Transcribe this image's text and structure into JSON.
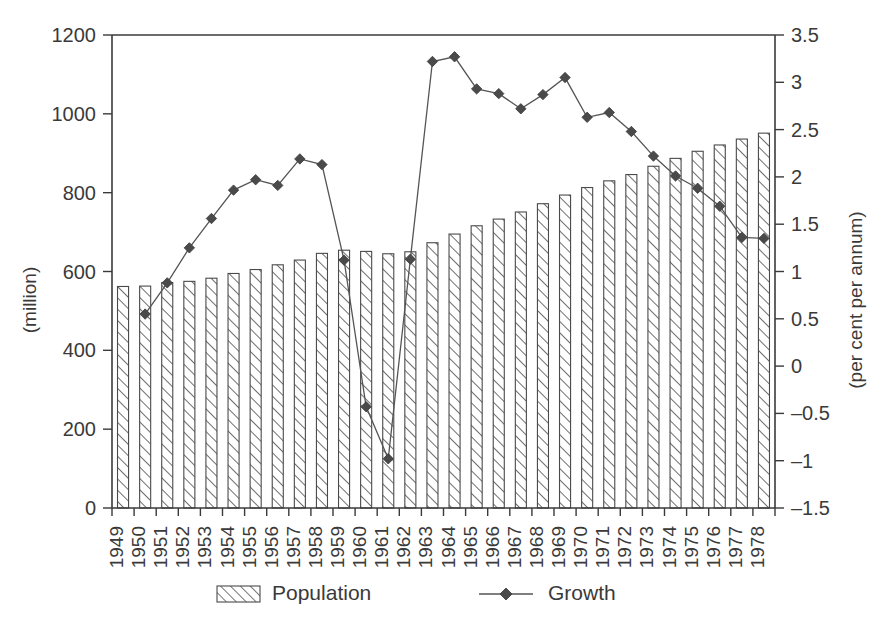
{
  "chart_data": {
    "type": "bar",
    "title": "",
    "subtitle": "",
    "xlabel": "",
    "ylabel": "(million)",
    "y2label": "(per cent per annum)",
    "ylim": [
      0,
      1200
    ],
    "y2lim": [
      -1.5,
      3.5
    ],
    "ytick_step": 200,
    "y2tick_step": 0.5,
    "grid": false,
    "legend_position": "bottom",
    "categories": [
      "1949",
      "1950",
      "1951",
      "1952",
      "1953",
      "1954",
      "1955",
      "1956",
      "1957",
      "1958",
      "1959",
      "1960",
      "1961",
      "1962",
      "1963",
      "1964",
      "1965",
      "1966",
      "1967",
      "1968",
      "1969",
      "1970",
      "1971",
      "1972",
      "1973",
      "1974",
      "1975",
      "1976",
      "1977",
      "1978"
    ],
    "yticks": [
      "0",
      "200",
      "400",
      "600",
      "800",
      "1000",
      "1200"
    ],
    "y2ticks": [
      "-1.5",
      "-1",
      "-0.5",
      "0",
      "0.5",
      "1",
      "1.5",
      "2",
      "2.5",
      "3",
      "3.5"
    ],
    "series": [
      {
        "name": "Population",
        "axis": "left",
        "type": "bar",
        "unit": "million",
        "values": [
          562,
          563,
          572,
          575,
          583,
          595,
          605,
          617,
          629,
          646,
          654,
          651,
          645,
          650,
          673,
          695,
          716,
          733,
          751,
          772,
          794,
          813,
          830,
          846,
          867,
          887,
          905,
          921,
          936,
          951
        ]
      },
      {
        "name": "Growth",
        "axis": "right",
        "type": "line",
        "marker": "diamond",
        "unit": "per cent per annum",
        "values": [
          null,
          0.55,
          0.88,
          1.25,
          1.56,
          1.86,
          1.97,
          1.91,
          2.19,
          2.13,
          1.12,
          -0.43,
          -0.98,
          1.13,
          3.22,
          3.27,
          2.93,
          2.88,
          2.72,
          2.87,
          3.05,
          2.63,
          2.68,
          2.48,
          2.22,
          2.01,
          1.88,
          1.69,
          1.36,
          1.35
        ]
      }
    ],
    "legend": [
      {
        "label": "Population",
        "style": "hatched-bar"
      },
      {
        "label": "Growth",
        "style": "line-diamond"
      }
    ],
    "colors": {
      "axis": "#3a3a3a",
      "bar_stroke": "#4a4a4a",
      "bar_fill": "#ffffff",
      "hatch": "#4a4a4a",
      "line": "#555555",
      "marker": "#4a4a4a",
      "background": "#ffffff"
    }
  }
}
